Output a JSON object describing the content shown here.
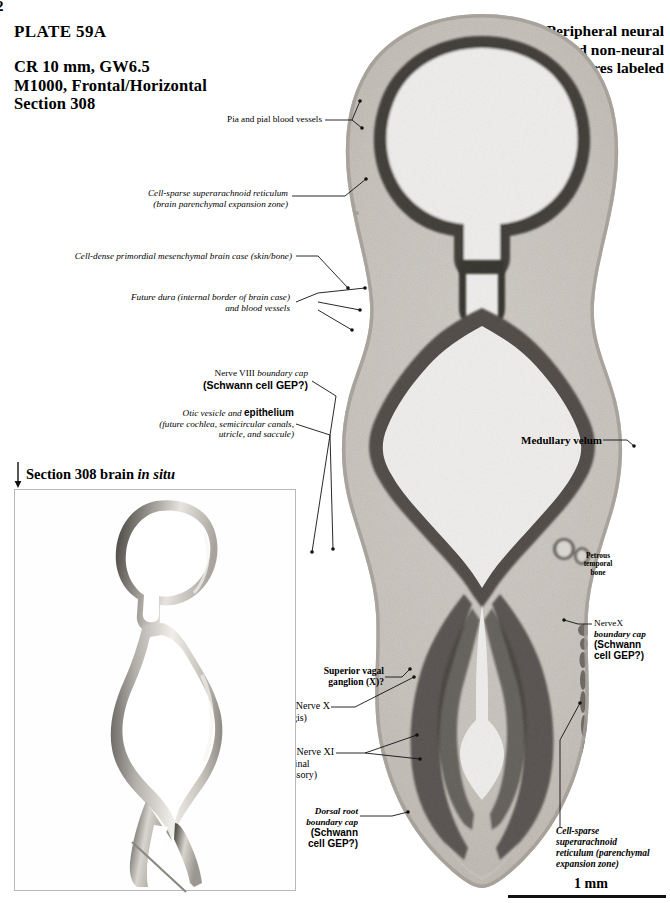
{
  "page": {
    "number": "2"
  },
  "header": {
    "plate": "PLATE 59A",
    "spec_line1": "CR 10 mm, GW6.5",
    "spec_line2": "M1000, Frontal/Horizontal",
    "spec_line3": "Section 308",
    "right_line1": "Peripheral neural",
    "right_line2": "and non-neural",
    "right_line3": "structures labeled"
  },
  "labels": {
    "pia": "Pia and pial blood vessels",
    "cell_sparse_1": "Cell-sparse superarachnoid reticulum",
    "cell_sparse_2": "(brain parenchymal expansion zone)",
    "cell_dense": "Cell-dense primordial mesenchymal brain case (skin/bone)",
    "future_dura_1": "Future dura (internal border of brain case)",
    "future_dura_2": "and blood vessels",
    "nerve8_a": "Nerve VIII ",
    "nerve8_b": "boundary cap",
    "nerve8_c": "(Schwann cell GEP?)",
    "otic_a": "Otic vesicle and ",
    "otic_b": "epithelium",
    "otic_c": "(future cochlea, semicircular canals,",
    "otic_d": "utricle, and saccule)",
    "medullary_velum": "Medullary velum",
    "petrous_1": "Petrous",
    "petrous_2": "temporal",
    "petrous_3": "bone",
    "nervex_1": "NerveX",
    "nervex_2": "boundary cap",
    "nervex_3": "(Schwann",
    "nervex_4": "cell GEP?)",
    "sup_vagal_1": "Superior vagal",
    "sup_vagal_2": "ganglion (X)?",
    "nerve_x_1": "Nerve X",
    "nerve_x_2": "(vagis)",
    "nerve_xi_1": "Nerve XI",
    "nerve_xi_2": "(spinal",
    "nerve_xi_3": "accessory)",
    "dorsal_1": "Dorsal root",
    "dorsal_2": "boundary cap",
    "dorsal_3": "(Schwann",
    "dorsal_4": "cell GEP?)",
    "cs_bottom_1": "Cell-sparse",
    "cs_bottom_2": "superarachnoid",
    "cs_bottom_3": "reticulum (parenchymal",
    "cs_bottom_4": "expansion zone)"
  },
  "inset": {
    "title_a": "Section 308 brain ",
    "title_b": "in situ"
  },
  "scale": {
    "label": "1 mm"
  },
  "colors": {
    "ink": "#111111",
    "mesenchyme_light": "#d9d6d0",
    "mesenchyme_mid": "#c3bfb8",
    "neural_dark": "#4a4743",
    "neural_darkest": "#1d1b19",
    "paper": "#ffffff",
    "inset_border": "#b9b9b9"
  }
}
